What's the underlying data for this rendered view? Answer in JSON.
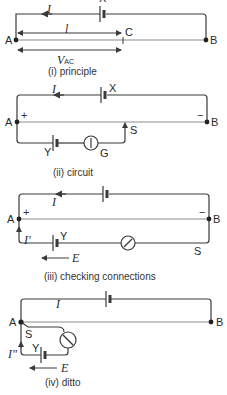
{
  "figure": {
    "panels": [
      {
        "id": "i",
        "caption": "(i) principle",
        "labels": {
          "current": "I",
          "cell": "X",
          "point_a": "A",
          "point_b": "B",
          "point_c": "C",
          "length": "l",
          "voltage_main": "V",
          "voltage_sub": "AC"
        }
      },
      {
        "id": "ii",
        "caption": "(ii) circuit",
        "labels": {
          "current": "I",
          "cell": "X",
          "point_a": "A",
          "point_b": "B",
          "plus": "+",
          "minus": "−",
          "cell_y": "Y",
          "galvanometer": "G",
          "slider": "S"
        }
      },
      {
        "id": "iii",
        "caption": "(iii) checking connections",
        "labels": {
          "current": "I",
          "branch_current": "I'",
          "point_a": "A",
          "point_b": "B",
          "plus": "+",
          "minus": "−",
          "cell_y": "Y",
          "slider": "S",
          "emf": "E"
        }
      },
      {
        "id": "iv",
        "caption": "(iv) ditto",
        "labels": {
          "current": "I",
          "branch_current": "I\"",
          "point_a": "A",
          "point_b": "B",
          "cell_y": "Y",
          "slider": "S",
          "emf": "E"
        }
      }
    ],
    "colors": {
      "line": "#3a3a3a",
      "wire_thin": "#8a8a8a",
      "background": "#ffffff"
    }
  }
}
